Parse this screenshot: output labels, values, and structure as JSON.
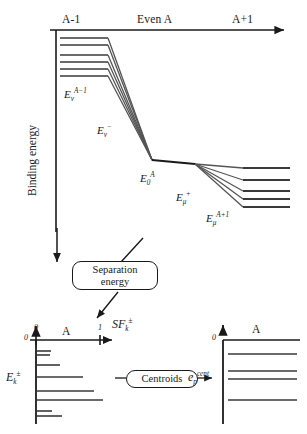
{
  "figure": {
    "type": "energy-level-diagram",
    "top_panel": {
      "yaxis_label": "Binding energy",
      "column_headers": [
        {
          "key": "left",
          "label": "A-1"
        },
        {
          "key": "center",
          "label": "Even A"
        },
        {
          "key": "right",
          "label": "A+1"
        }
      ],
      "level_labels": [
        {
          "key": "a_minus_1_levels",
          "base": "E",
          "sub": "ν",
          "sup": "A−1"
        },
        {
          "key": "transition_minus",
          "base": "E",
          "sub": "ν",
          "sup": "−"
        },
        {
          "key": "ground_state",
          "base": "E",
          "sub": "0",
          "sup": "A"
        },
        {
          "key": "transition_plus",
          "base": "E",
          "sub": "μ",
          "sup": "+"
        },
        {
          "key": "a_plus_1_levels",
          "base": "E",
          "sub": "μ",
          "sup": "A+1"
        }
      ],
      "left_levels_count": 6,
      "right_levels_count": 5
    },
    "connector": {
      "box_label_line1": "Separation",
      "box_label_line2": "energy"
    },
    "bottom_left_panel": {
      "origin_label": "0",
      "axis_zero_tick": "0",
      "axis_one_tick": "1",
      "axis_mid_label": "A",
      "axis_label": {
        "base": "SF",
        "sub": "k",
        "sup": "±"
      },
      "energy_label": {
        "base": "E",
        "sub": "k",
        "sup": "±"
      },
      "strengths": [
        0.18,
        0.16,
        0.3,
        0.6,
        0.74,
        0.92,
        0.2,
        0.33
      ]
    },
    "bottom_right_panel": {
      "origin_label": "0",
      "axis_mid_label": "A",
      "energy_label": {
        "base": "e",
        "sub": "p",
        "sup": "cent"
      },
      "levels_count": 5
    },
    "center_box": {
      "label": "Centroids"
    },
    "colors": {
      "ink": "#1a1a1a",
      "line": "#3a3a3a",
      "background": "#ffffff"
    }
  }
}
